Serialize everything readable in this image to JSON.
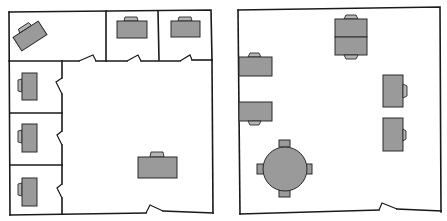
{
  "diagram": {
    "type": "floor-plan-comparison",
    "colors": {
      "wall": "#1a1a1a",
      "furniture": "#9a9a9a",
      "background": "#ffffff"
    },
    "plans": [
      {
        "id": "left",
        "label": "Floor plan with private offices",
        "rooms": [
          {
            "id": "office-top-left",
            "desks": 1,
            "orientation": "rotated"
          },
          {
            "id": "office-top-middle",
            "desks": 1
          },
          {
            "id": "office-top-right",
            "desks": 1
          },
          {
            "id": "office-left-1",
            "desks": 1
          },
          {
            "id": "office-left-2",
            "desks": 1
          },
          {
            "id": "office-left-3",
            "desks": 1
          },
          {
            "id": "open-area",
            "desks": 1
          }
        ],
        "doors": 7
      },
      {
        "id": "right",
        "label": "Open-plan floor",
        "rooms": [
          {
            "id": "open-office",
            "desks": 6,
            "round_table": 1,
            "table_chairs": 4
          }
        ],
        "doors": 1
      }
    ]
  }
}
